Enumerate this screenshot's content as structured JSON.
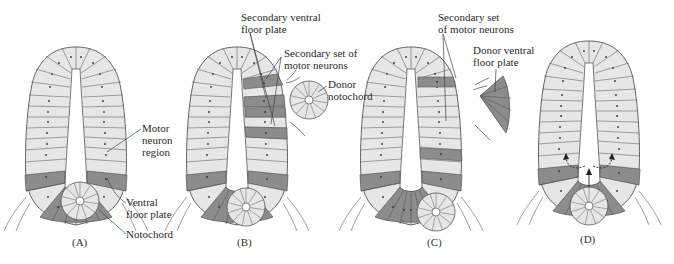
{
  "figure": {
    "panels": [
      {
        "id": "A",
        "label": "(A)"
      },
      {
        "id": "B",
        "label": "(B)"
      },
      {
        "id": "C",
        "label": "(C)"
      },
      {
        "id": "D",
        "label": "(D)"
      }
    ],
    "labels": {
      "motor_neuron_region_1": "Motor",
      "motor_neuron_region_2": "neuron",
      "motor_neuron_region_3": "region",
      "ventral_floor_plate_1": "Ventral",
      "ventral_floor_plate_2": "floor plate",
      "notochord": "Notochord",
      "secondary_ventral_floor_plate_1": "Secondary ventral",
      "secondary_ventral_floor_plate_2": "floor plate",
      "secondary_motor_neurons_B_1": "Secondary set of",
      "secondary_motor_neurons_B_2": "motor neurons",
      "donor_notochord_1": "Donor",
      "donor_notochord_2": "notochord",
      "secondary_motor_neurons_C_1": "Secondary set",
      "secondary_motor_neurons_C_2": "of motor neurons",
      "donor_ventral_floor_plate_1": "Donor ventral",
      "donor_ventral_floor_plate_2": "floor plate"
    },
    "colors": {
      "light_cell": "#e6e6e6",
      "dark_cell": "#8c8c8c",
      "outline": "#555555",
      "background": "#ffffff"
    }
  }
}
